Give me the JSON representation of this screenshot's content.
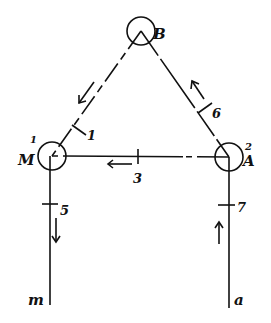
{
  "diagram": {
    "nodes": [
      {
        "id": "B",
        "label": "B",
        "number": ""
      },
      {
        "id": "M",
        "label": "M",
        "number": "1"
      },
      {
        "id": "A",
        "label": "A",
        "number": "2"
      }
    ],
    "edges": [
      {
        "from": "B",
        "to": "M",
        "label": "1",
        "arrow": "toward M"
      },
      {
        "from": "A",
        "to": "B",
        "label": "6",
        "arrow": "toward B"
      },
      {
        "from": "A",
        "to": "M",
        "label": "3",
        "arrow": "toward M"
      },
      {
        "from": "M",
        "to": "m",
        "label": "5",
        "arrow": "down"
      },
      {
        "from": "a",
        "to": "A",
        "label": "7",
        "arrow": "up"
      }
    ],
    "terminals": {
      "left": "m",
      "right": "a"
    }
  }
}
